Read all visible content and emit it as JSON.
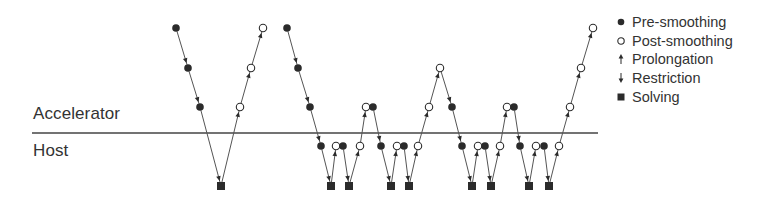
{
  "zones": {
    "upper_label": "Accelerator",
    "lower_label": "Host"
  },
  "legend": {
    "items": [
      {
        "key": "pre",
        "label": "Pre-smoothing",
        "marker": "filled-circle"
      },
      {
        "key": "post",
        "label": "Post-smoothing",
        "marker": "open-circle"
      },
      {
        "key": "prolong",
        "label": "Prolongation",
        "marker": "up-arrow"
      },
      {
        "key": "restrict",
        "label": "Restriction",
        "marker": "down-arrow"
      },
      {
        "key": "solve",
        "label": "Solving",
        "marker": "filled-square"
      }
    ]
  },
  "diagram": {
    "colors": {
      "ink": "#2b2b2b",
      "line": "#555555",
      "background": "#ffffff"
    },
    "levels_y": [
      28,
      68,
      107,
      146,
      186
    ],
    "separator": {
      "x1": 32,
      "x2": 598,
      "y": 133
    },
    "cycles": [
      {
        "name": "v-cycle",
        "nodes": [
          {
            "t": "pre",
            "x": 176,
            "l": 0
          },
          {
            "t": "pre",
            "x": 188,
            "l": 1
          },
          {
            "t": "pre",
            "x": 200,
            "l": 2
          },
          {
            "t": "solve",
            "x": 221,
            "l": 4
          },
          {
            "t": "post",
            "x": 240,
            "l": 2
          },
          {
            "t": "post",
            "x": 251,
            "l": 1
          },
          {
            "t": "post",
            "x": 263,
            "l": 0
          }
        ]
      },
      {
        "name": "w-cycle",
        "nodes": [
          {
            "t": "pre",
            "x": 287,
            "l": 0
          },
          {
            "t": "pre",
            "x": 298,
            "l": 1
          },
          {
            "t": "pre",
            "x": 310,
            "l": 2
          },
          {
            "t": "pre",
            "x": 321,
            "l": 3
          },
          {
            "t": "solve",
            "x": 331,
            "l": 4
          },
          {
            "t": "post",
            "x": 336,
            "l": 3
          },
          {
            "t": "pre",
            "x": 343,
            "l": 3,
            "pair": true
          },
          {
            "t": "solve",
            "x": 349,
            "l": 4
          },
          {
            "t": "post",
            "x": 360,
            "l": 3
          },
          {
            "t": "post",
            "x": 366,
            "l": 2
          },
          {
            "t": "pre",
            "x": 373,
            "l": 2,
            "pair": true
          },
          {
            "t": "pre",
            "x": 381,
            "l": 3
          },
          {
            "t": "solve",
            "x": 391,
            "l": 4
          },
          {
            "t": "post",
            "x": 397,
            "l": 3
          },
          {
            "t": "pre",
            "x": 404,
            "l": 3,
            "pair": true
          },
          {
            "t": "solve",
            "x": 409,
            "l": 4
          },
          {
            "t": "post",
            "x": 418,
            "l": 3
          },
          {
            "t": "post",
            "x": 429,
            "l": 2
          },
          {
            "t": "post",
            "x": 440,
            "l": 1
          },
          {
            "t": "pre",
            "x": 452,
            "l": 2
          },
          {
            "t": "pre",
            "x": 462,
            "l": 3
          },
          {
            "t": "solve",
            "x": 472,
            "l": 4
          },
          {
            "t": "post",
            "x": 478,
            "l": 3
          },
          {
            "t": "pre",
            "x": 485,
            "l": 3,
            "pair": true
          },
          {
            "t": "solve",
            "x": 491,
            "l": 4
          },
          {
            "t": "post",
            "x": 500,
            "l": 3
          },
          {
            "t": "post",
            "x": 507,
            "l": 2
          },
          {
            "t": "pre",
            "x": 514,
            "l": 2,
            "pair": true
          },
          {
            "t": "pre",
            "x": 520,
            "l": 3
          },
          {
            "t": "solve",
            "x": 529,
            "l": 4
          },
          {
            "t": "post",
            "x": 536,
            "l": 3
          },
          {
            "t": "pre",
            "x": 544,
            "l": 3,
            "pair": true
          },
          {
            "t": "solve",
            "x": 549,
            "l": 4
          },
          {
            "t": "post",
            "x": 559,
            "l": 3
          },
          {
            "t": "post",
            "x": 570,
            "l": 2
          },
          {
            "t": "post",
            "x": 581,
            "l": 1
          },
          {
            "t": "post",
            "x": 593,
            "l": 0
          }
        ]
      }
    ]
  }
}
